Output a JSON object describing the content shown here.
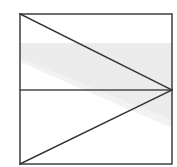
{
  "figure": {
    "canvas": {
      "width": 177,
      "height": 167,
      "background": "#ffffff"
    },
    "colors": {
      "stroke": "#4a4a4a",
      "stroke_dark": "#333333",
      "shade": "#ececec",
      "shade_light": "#f2f2f2",
      "background": "#ffffff"
    },
    "stroke_width": 1.6,
    "rectangle": {
      "name": "outer-rectangle",
      "x": 20,
      "y": 14,
      "width": 152,
      "height": 150,
      "corners": [
        [
          20,
          14
        ],
        [
          172,
          14
        ],
        [
          172,
          164
        ],
        [
          20,
          164
        ]
      ]
    },
    "midline": {
      "name": "horizontal-midline",
      "from": [
        20,
        90
      ],
      "to": [
        172,
        90
      ]
    },
    "diagonals": [
      {
        "name": "upper-diagonal",
        "from": [
          20,
          14
        ],
        "to": [
          172,
          90
        ]
      },
      {
        "name": "lower-diagonal",
        "from": [
          20,
          164
        ],
        "to": [
          172,
          90
        ]
      }
    ],
    "vertex": {
      "name": "convergence-vertex",
      "x": 172,
      "y": 90
    },
    "shaded_band": {
      "name": "shaded-wedge-band",
      "fill": "#ececec",
      "points": [
        [
          20,
          43
        ],
        [
          172,
          43
        ],
        [
          172,
          120
        ],
        [
          20,
          58
        ]
      ]
    },
    "shaded_band_secondary": {
      "name": "shaded-wedge-band-tail",
      "fill": "#f2f2f2",
      "points": [
        [
          20,
          43
        ],
        [
          172,
          43
        ],
        [
          172,
          128
        ],
        [
          20,
          62
        ]
      ]
    }
  }
}
